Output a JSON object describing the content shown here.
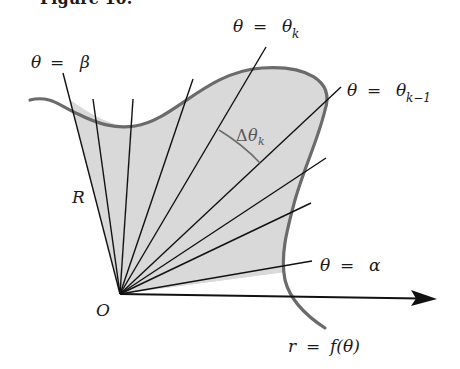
{
  "figure": {
    "partial_heading": "Figure 10.",
    "colors": {
      "region_fill": "#d9d9d9",
      "curve_stroke": "#6b6b6b",
      "ray_stroke": "#111111",
      "axis_stroke": "#111111",
      "label_text": "#1a1a1a",
      "curve_label_text": "#5a5a5a"
    },
    "origin": {
      "label": "O",
      "x": 120,
      "y": 294
    },
    "polar_axis": {
      "from": [
        120,
        294
      ],
      "to": [
        436,
        299
      ],
      "arrow": true
    },
    "labels": {
      "theta_beta": {
        "theta": "θ",
        "eq": "=",
        "value": "β"
      },
      "theta_k": {
        "theta": "θ",
        "eq": "=",
        "value": "θ",
        "sub": "k"
      },
      "theta_k_minus_1": {
        "theta": "θ",
        "eq": "=",
        "value": "θ",
        "sub": "k−1"
      },
      "delta_theta_k": {
        "delta": "Δ",
        "theta": "θ",
        "sub": "k"
      },
      "radius": "R",
      "theta_alpha": {
        "theta": "θ",
        "eq": "=",
        "value": "α"
      },
      "curve": {
        "r": "r",
        "eq": "=",
        "f": "f(θ)"
      }
    },
    "rays": [
      {
        "name": "ray-beta",
        "to": [
          63,
          73
        ]
      },
      {
        "name": "ray-2",
        "to": [
          93,
          99
        ]
      },
      {
        "name": "ray-3",
        "to": [
          133,
          99
        ]
      },
      {
        "name": "ray-4",
        "to": [
          193,
          79
        ]
      },
      {
        "name": "ray-theta-k",
        "to": [
          266,
          47
        ]
      },
      {
        "name": "ray-theta-k-minus-1",
        "to": [
          341,
          87
        ]
      },
      {
        "name": "ray-7",
        "to": [
          326,
          158
        ]
      },
      {
        "name": "ray-8",
        "to": [
          311,
          203
        ]
      },
      {
        "name": "ray-alpha",
        "to": [
          312,
          261
        ]
      }
    ]
  }
}
